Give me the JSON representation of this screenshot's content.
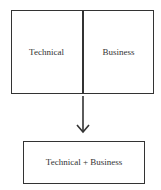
{
  "diagram": {
    "top_box": {
      "left_label": "Technical",
      "right_label": "Business"
    },
    "arrow": {
      "direction": "down",
      "icon": "arrow-down-icon"
    },
    "bottom_box": {
      "label": "Technical + Business"
    },
    "colors": {
      "stroke": "#333333",
      "background": "#ffffff",
      "text": "#333333"
    }
  }
}
